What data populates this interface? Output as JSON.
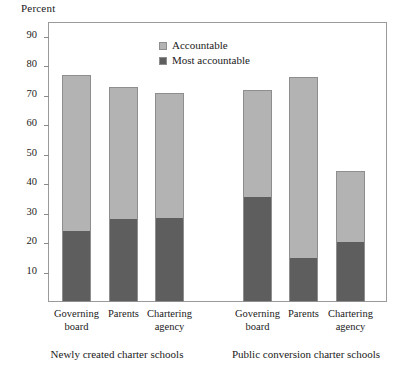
{
  "axis_unit_label": "Percent",
  "legend": [
    {
      "name": "legend-accountable",
      "label": "Accountable",
      "color": "#b3b3b3"
    },
    {
      "name": "legend-most-accountable",
      "label": "Most accountable",
      "color": "#5e5e5e"
    }
  ],
  "yticks": [
    "90",
    "80",
    "70",
    "60",
    "50",
    "40",
    "30",
    "20",
    "10"
  ],
  "xlabels": [
    "Governing\nboard",
    "Parents",
    "Chartering\nagency",
    "Governing\nboard",
    "Parents",
    "Chartering\nagency"
  ],
  "group_labels": [
    "Newly created charter schools",
    "Public conversion charter schools"
  ],
  "chart_data": {
    "type": "bar",
    "title": "",
    "subtitle": "",
    "xlabel": "",
    "ylabel": "Percent",
    "ylim": [
      0,
      95
    ],
    "ytick_values": [
      90,
      80,
      70,
      60,
      50,
      40,
      30,
      20,
      10
    ],
    "grid": false,
    "stacked": true,
    "legend_position": "inside-top-center",
    "groups": [
      {
        "name": "Newly created charter schools",
        "categories": [
          "Governing board",
          "Parents",
          "Chartering agency"
        ]
      },
      {
        "name": "Public conversion charter schools",
        "categories": [
          "Governing board",
          "Parents",
          "Chartering agency"
        ]
      }
    ],
    "categories": [
      "Governing board",
      "Parents",
      "Chartering agency",
      "Governing board",
      "Parents",
      "Chartering agency"
    ],
    "series": [
      {
        "name": "Most accountable",
        "color": "#5e5e5e",
        "values": [
          24,
          28,
          28.5,
          35.5,
          15,
          20.5
        ]
      },
      {
        "name": "Accountable",
        "color": "#b3b3b3",
        "values": [
          53,
          45,
          42.5,
          36.5,
          61.5,
          24
        ]
      }
    ],
    "totals": [
      77,
      73,
      71,
      72,
      76.5,
      44.5
    ]
  }
}
